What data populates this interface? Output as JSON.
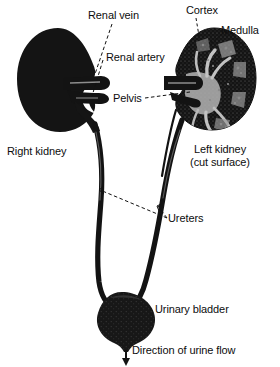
{
  "figure": {
    "background_color": "#ffffff",
    "ink_color": "#111111"
  },
  "labels": {
    "renal_vein": "Renal vein",
    "renal_artery": "Renal artery",
    "cortex": "Cortex",
    "medulla": "Medulla",
    "pelvis": "Pelvis",
    "right_kidney": "Right kidney",
    "left_kidney_line1": "Left kidney",
    "left_kidney_line2": "(cut surface)",
    "ureters": "Ureters",
    "urinary_bladder": "Urinary bladder",
    "urine_flow": "Direction of urine flow"
  },
  "icons": {
    "urine_flow_arrow": "down-arrow-icon"
  },
  "structures": [
    {
      "name": "right-kidney",
      "description": "solid bean-shaped kidney, whole (uncut), left side of figure"
    },
    {
      "name": "left-kidney",
      "description": "bean-shaped kidney shown in longitudinal section revealing cortex, medulla, pyramids, calyces and renal pelvis"
    },
    {
      "name": "renal-vein",
      "description": "large vessel entering kidney hilum"
    },
    {
      "name": "renal-artery",
      "description": "vessel entering kidney hilum behind vein"
    },
    {
      "name": "renal-pelvis",
      "description": "funnel-shaped collecting space continuous with ureter"
    },
    {
      "name": "ureter-right",
      "description": "long tube from right kidney to bladder"
    },
    {
      "name": "ureter-left",
      "description": "long tube from left kidney to bladder"
    },
    {
      "name": "urinary-bladder",
      "description": "rounded sac receiving both ureters"
    },
    {
      "name": "urethra",
      "description": "short outflow tube at bladder neck"
    }
  ]
}
